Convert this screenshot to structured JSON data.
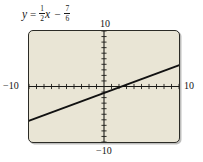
{
  "equation": {
    "lhs": "y",
    "equals": "=",
    "slope_numerator": "1",
    "slope_denominator": "2",
    "slope_var": "x",
    "operator": "−",
    "intercept_numerator": "7",
    "intercept_denominator": "6",
    "plain": "y = 1/2 x − 7/6"
  },
  "labels": {
    "top": "10",
    "bottom": "−10",
    "left": "−10",
    "right": "10"
  },
  "colors": {
    "window_background": "#e9e5d5",
    "window_border": "#2b2b26",
    "axis": "#1a1a17",
    "line": "#111111",
    "page_background": "#ffffff"
  },
  "chart_data": {
    "type": "line",
    "xlabel": "",
    "ylabel": "",
    "xlim": [
      -10,
      10
    ],
    "ylim": [
      -10,
      10
    ],
    "grid": false,
    "legend": "none",
    "x_tick_interval": 1,
    "y_tick_interval": 1,
    "x_tick_labels": [
      "−10",
      "10"
    ],
    "y_tick_labels": [
      "−10",
      "10"
    ],
    "series": [
      {
        "name": "y = 1/2 x − 7/6",
        "slope": 0.5,
        "intercept": -1.1667,
        "x_intercept": 2.3333,
        "x": [
          -10,
          -5,
          0,
          2.3333,
          5,
          10
        ],
        "y": [
          -6.1667,
          -3.6667,
          -1.1667,
          0,
          1.3333,
          3.8333
        ]
      }
    ]
  }
}
